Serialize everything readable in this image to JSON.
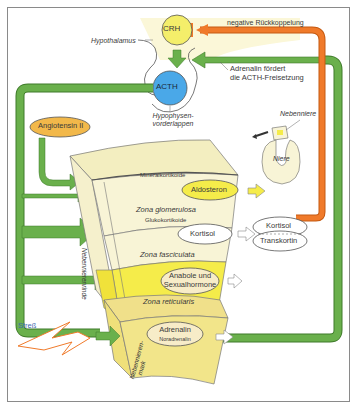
{
  "diagram": {
    "nodes": {
      "crh": "CRH",
      "acth": "ACTH",
      "angiotensin": "Angiotensin II",
      "aldosteron": "Aldosteron",
      "kortisol": "Kortisol",
      "anabole_line1": "Anabole und",
      "anabole_line2": "Sexualhormone",
      "adrenalin": "Adrenalin",
      "noradrenalin": "Noradrenalin",
      "kortisol_bound": "Kortisol",
      "transkortin": "Transkortin"
    },
    "labels": {
      "hypothalamus": "Hypothalamus",
      "hypophyse_line1": "Hypophysen-",
      "hypophyse_line2": "vorderlappen",
      "negative_feedback": "negative Rückkoppelung",
      "adrenalin_note_line1": "Adrenalin fördert",
      "adrenalin_note_line2": "die ACTH-Freisetzung",
      "nebenniere": "Nebenniere",
      "niere": "Niere",
      "mineralkortikoide": "Mineralkortikoide",
      "zona_glomerulosa": "Zona glomerulosa",
      "glukokortikoide": "Glukokortikoide",
      "zona_fasciculata": "Zona fasciculata",
      "zona_reticularis": "Zona reticularis",
      "nebennierenrinde": "Nebennierenrinde",
      "nebennierenmark_line1": "Nebennieren-",
      "nebennierenmark_line2": "mark",
      "stress": "Streß"
    },
    "colors": {
      "green": "#6ab04c",
      "green_dark": "#3f7a2a",
      "orange": "#f07a2a",
      "yellow": "#f5ec4a",
      "cream": "#f6f1cf",
      "blue": "#4aa8e8",
      "crh_yellow": "#f4ee6a",
      "angiotensin_fill": "#f2b84a"
    }
  }
}
